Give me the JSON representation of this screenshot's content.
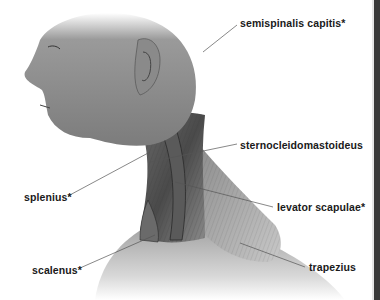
{
  "figure": {
    "labels": [
      {
        "id": "semispinalis",
        "text": "semispinalis capitis*",
        "x": 240,
        "y": 17
      },
      {
        "id": "scm",
        "text": "sternocleidomastoideus",
        "x": 240,
        "y": 139
      },
      {
        "id": "splenius",
        "text": "splenius*",
        "x": 24,
        "y": 191
      },
      {
        "id": "levator",
        "text": "levator scapulae*",
        "x": 277,
        "y": 201
      },
      {
        "id": "scalenus",
        "text": "scalenus*",
        "x": 32,
        "y": 264
      },
      {
        "id": "trapezius",
        "text": "trapezius",
        "x": 309,
        "y": 261
      }
    ]
  },
  "colors": {
    "background": "#ffffff",
    "label_text": "#1a1a1a",
    "leader_line": "#555555",
    "frame_bar": "#3a3a3a"
  }
}
